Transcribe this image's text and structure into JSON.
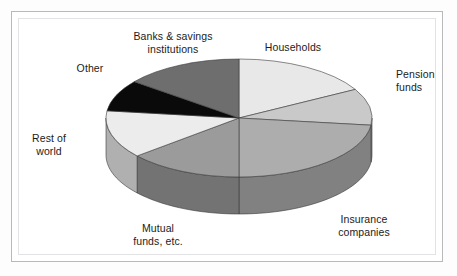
{
  "figure": {
    "background": "#ffffff",
    "frame_color": "#b9b9bd"
  },
  "chart_data": {
    "type": "pie",
    "title": "",
    "subtitle": "",
    "xlabel": "",
    "ylabel": "",
    "legend_position": "none",
    "grid": false,
    "three_d": true,
    "start_angle_deg": 0,
    "direction": "clockwise",
    "labels": [
      "Households",
      "Pension funds",
      "Insurance companies",
      "Mutual funds, etc.",
      "Rest of world",
      "Other",
      "Banks & savings institutions"
    ],
    "values": [
      17,
      10,
      23,
      14,
      13,
      9,
      14
    ],
    "units": "percent",
    "categories": [
      "Households",
      "Pension funds",
      "Insurance companies",
      "Mutual funds, etc.",
      "Rest of world",
      "Other",
      "Banks & savings institutions"
    ],
    "series": [
      {
        "name": "Share of holdings",
        "values": [
          17,
          10,
          23,
          14,
          13,
          9,
          14
        ]
      }
    ],
    "slices": [
      {
        "label": "Households",
        "value": 17,
        "start_deg": 0,
        "end_deg": 61,
        "top_color": "#e8e8e8",
        "side_color": "#a9a9a9"
      },
      {
        "label": "Pension funds",
        "value": 10,
        "start_deg": 61,
        "end_deg": 97,
        "top_color": "#c9c9c9",
        "side_color": "#9a9a9a"
      },
      {
        "label": "Insurance companies",
        "value": 23,
        "start_deg": 97,
        "end_deg": 180,
        "top_color": "#adadad",
        "side_color": "#818181"
      },
      {
        "label": "Mutual funds, etc.",
        "value": 14,
        "start_deg": 180,
        "end_deg": 230,
        "top_color": "#9b9b9b",
        "side_color": "#737373"
      },
      {
        "label": "Rest of world",
        "value": 13,
        "start_deg": 230,
        "end_deg": 277,
        "top_color": "#ececec",
        "side_color": "#b0b0b0"
      },
      {
        "label": "Other",
        "value": 9,
        "start_deg": 277,
        "end_deg": 308,
        "top_color": "#0a0a0a",
        "side_color": "#000000"
      },
      {
        "label": "Banks & savings institutions",
        "value": 14,
        "start_deg": 308,
        "end_deg": 360,
        "top_color": "#6e6e6e",
        "side_color": "#525252"
      }
    ]
  },
  "labels": {
    "banks": "Banks & savings\ninstitutions",
    "households": "Households",
    "pension": "Pension\nfunds",
    "insurance": "Insurance\ncompanies",
    "mutual": "Mutual\nfunds, etc.",
    "rest_of_world": "Rest of\nworld",
    "other": "Other"
  }
}
